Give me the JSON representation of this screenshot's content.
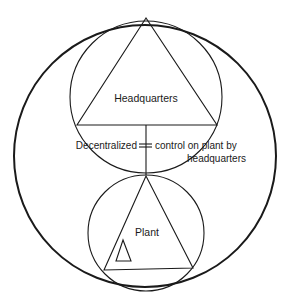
{
  "diagram": {
    "labels": {
      "headquarters": "Headquarters",
      "plant": "Plant",
      "decentralized": "Decentralized",
      "relation_line1": "control on plant by",
      "relation_line2": "headquarters"
    },
    "colors": {
      "stroke": "#1a1a1a",
      "background": "#ffffff"
    }
  }
}
